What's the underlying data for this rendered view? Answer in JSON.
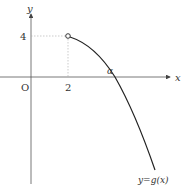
{
  "diagram": {
    "axis_labels": {
      "x": "x",
      "y": "y",
      "origin": "O"
    },
    "tick_labels": {
      "x_tick": "2",
      "y_tick": "4"
    },
    "root_label": "α",
    "curve_label": "y=g(x)",
    "open_point": {
      "x": 2,
      "y": 4
    },
    "colors": {
      "curve": "#222222",
      "axis": "#555555",
      "guide": "#aaaaaa"
    }
  }
}
